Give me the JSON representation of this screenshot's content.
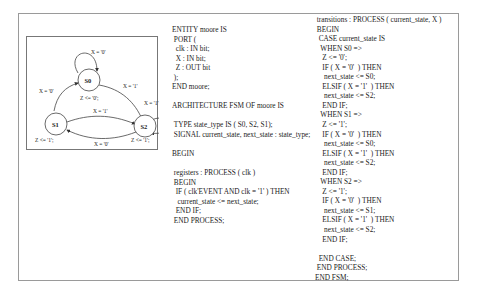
{
  "diagram": {
    "states": [
      {
        "id": "S0",
        "label": "S0",
        "output": "Z <= '0';"
      },
      {
        "id": "S1",
        "label": "S1",
        "output": "Z <= '1';"
      },
      {
        "id": "S2",
        "label": "S2",
        "output": "Z <= '1';"
      }
    ],
    "transitions": [
      {
        "from": "S0",
        "to": "S0",
        "label": "X = '0'"
      },
      {
        "from": "S0",
        "to": "S2",
        "label": "X = '1'"
      },
      {
        "from": "S1",
        "to": "S0",
        "label": "X = '0'"
      },
      {
        "from": "S1",
        "to": "S2",
        "label": "X = '1'"
      },
      {
        "from": "S2",
        "to": "S1",
        "label": "X = '0'"
      },
      {
        "from": "S2",
        "to": "S2",
        "label": "X = '1'"
      }
    ]
  },
  "code": {
    "left": [
      "ENTITY moore IS",
      " PORT (",
      "  clk : IN bit;",
      "  X : IN bit;",
      "  Z : OUT bit",
      " );",
      "END moore;",
      "",
      "ARCHITECTURE FSM OF moore IS",
      "",
      " TYPE state_type IS ( S0, S2, S1);",
      " SIGNAL current_state, next_state : state_type;",
      "",
      "BEGIN",
      "",
      " registers : PROCESS ( clk )",
      " BEGIN",
      "  IF ( clk'EVENT AND clk = '1' ) THEN",
      "   current_state <= next_state;",
      "  END IF;",
      " END PROCESS;"
    ],
    "right": [
      " transitions : PROCESS ( current_state, X )",
      " BEGIN",
      "  CASE current_state IS",
      "   WHEN S0 =>",
      "    Z <= '0';",
      "    IF ( X = '0'  ) THEN",
      "     next_state <= S0;",
      "    ELSIF ( X = '1'  ) THEN",
      "     next_state <= S2;",
      "    END IF;",
      "   WHEN S1 =>",
      "    Z <= '1';",
      "    IF ( X = '0'  ) THEN",
      "     next_state <= S0;",
      "    ELSIF ( X = '1'  ) THEN",
      "     next_state <= S2;",
      "    END IF;",
      "   WHEN S2 =>",
      "    Z <= '1';",
      "    IF ( X = '0'  ) THEN",
      "     next_state <= S1;",
      "    ELSIF ( X = '1'  ) THEN",
      "     next_state <= S2;",
      "    END IF;",
      "",
      "  END CASE;",
      " END PROCESS;",
      "END FSM;"
    ]
  }
}
